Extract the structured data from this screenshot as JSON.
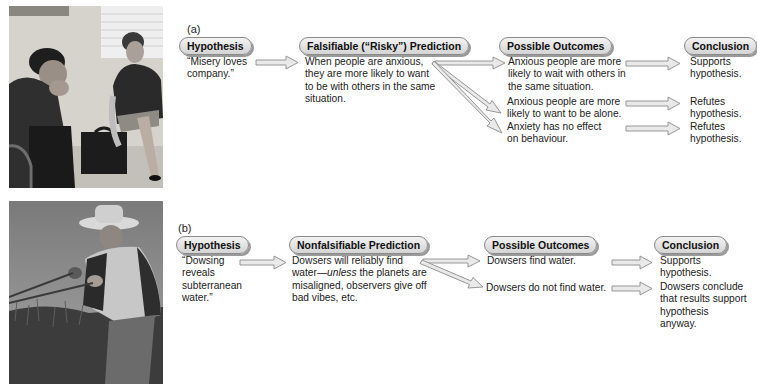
{
  "panels": [
    {
      "label": "(a)",
      "photo": {
        "icon": "photo-two-people-waiting",
        "alt": "Two anxious people waiting"
      },
      "headers": {
        "hypothesis": "Hypothesis",
        "prediction": "Falsifiable (“Risky”) Prediction",
        "outcomes": "Possible Outcomes",
        "conclusion": "Conclusion"
      },
      "hypothesis": "“Misery loves company.”",
      "prediction": "When people are anxious, they are more likely to want to be with others in the same situation.",
      "rows": [
        {
          "outcome": "Anxious people are more likely to wait with others in the same situation.",
          "conclusion": "Supports hypothesis."
        },
        {
          "outcome": "Anxious people are more likely to want to be alone.",
          "conclusion": "Refutes hypothesis."
        },
        {
          "outcome": "Anxiety has no effect on behaviour.",
          "conclusion": "Refutes hypothesis."
        }
      ]
    },
    {
      "label": "(b)",
      "photo": {
        "icon": "photo-dowser-in-field",
        "alt": "Man dowsing in a field"
      },
      "headers": {
        "hypothesis": "Hypothesis",
        "prediction": "Nonfalsifiable Prediction",
        "outcomes": "Possible Outcomes",
        "conclusion": "Conclusion"
      },
      "hypothesis": "“Dowsing reveals subterranean water.”",
      "prediction_pre": "Dowsers will reliably find water—",
      "prediction_em": "unless",
      "prediction_post": " the planets are misaligned, observers give off bad vibes, etc.",
      "rows": [
        {
          "outcome": "Dowsers find water.",
          "conclusion": "Supports hypothesis."
        },
        {
          "outcome": "Dowsers do not find water.",
          "conclusion": "Dowsers conclude that results support hypothesis anyway."
        }
      ]
    }
  ],
  "colors": {
    "arrow_fill": "#e6e6e6",
    "arrow_stroke": "#8c8c8c",
    "pill_border": "#8a8a8a"
  }
}
